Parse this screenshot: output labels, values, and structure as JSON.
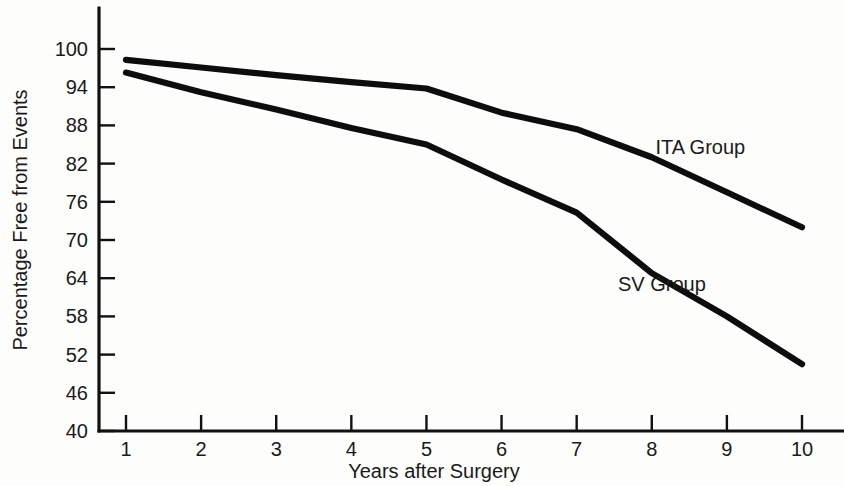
{
  "chart_data": {
    "type": "line",
    "title": "",
    "xlabel": "Years after Surgery",
    "ylabel": "Percentage Free from Events",
    "x": [
      1,
      2,
      3,
      4,
      5,
      6,
      7,
      8,
      9,
      10
    ],
    "xtick_labels": [
      "1",
      "2",
      "3",
      "4",
      "5",
      "6",
      "7",
      "8",
      "9",
      "10"
    ],
    "ytick_labels": [
      "40",
      "46",
      "52",
      "58",
      "64",
      "70",
      "76",
      "82",
      "88",
      "94",
      "100"
    ],
    "yticks": [
      40,
      46,
      52,
      58,
      64,
      70,
      76,
      82,
      88,
      94,
      100
    ],
    "xlim": [
      0.55,
      10.45
    ],
    "ylim": [
      40,
      103
    ],
    "grid": false,
    "legend": "inline-labels",
    "series": [
      {
        "name": "ITA Group",
        "label": "ITA Group",
        "color": "#0d0d0d",
        "label_x": 8.05,
        "label_y": 83.5,
        "values": [
          98.3,
          97.1,
          95.9,
          94.8,
          93.8,
          90.0,
          87.4,
          83.0,
          77.5,
          72.0
        ]
      },
      {
        "name": "SV Group",
        "label": "SV Group",
        "color": "#0d0d0d",
        "label_x": 7.55,
        "label_y": 62.0,
        "values": [
          96.3,
          93.2,
          90.5,
          87.6,
          85.0,
          79.5,
          74.3,
          64.8,
          58.0,
          50.5
        ]
      }
    ]
  },
  "axis": {
    "y_title": "Percentage Free from Events",
    "x_title": "Years after Surgery"
  }
}
